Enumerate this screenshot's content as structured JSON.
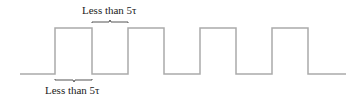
{
  "diagram": {
    "type": "square-wave",
    "waveform_color": "#aaaaaa",
    "bracket_color": "#555555",
    "top_label": "Less than 5τ",
    "bottom_label": "Less than 5τ",
    "pulses": 4
  }
}
